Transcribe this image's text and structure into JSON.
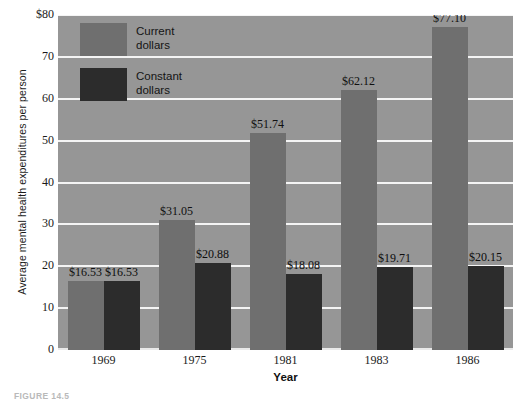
{
  "chart_data": {
    "type": "bar",
    "title": "",
    "xlabel": "Year",
    "ylabel": "Average mental health expenditures per person",
    "categories": [
      "1969",
      "1975",
      "1981",
      "1983",
      "1986"
    ],
    "ylim": [
      0,
      80
    ],
    "yticks": [
      "0",
      "10",
      "20",
      "30",
      "40",
      "50",
      "60",
      "70",
      "$80"
    ],
    "ytick_values": [
      0,
      10,
      20,
      30,
      40,
      50,
      60,
      70,
      80
    ],
    "grid": true,
    "legend_position": "top-left-inside",
    "series": [
      {
        "name": "Current dollars",
        "color": "#6f6f6f",
        "values": [
          16.53,
          31.05,
          51.74,
          62.12,
          77.1
        ],
        "labels": [
          "$16.53",
          "$31.05",
          "$51.74",
          "$62.12",
          "$77.10"
        ]
      },
      {
        "name": "Constant dollars",
        "color": "#2c2c2c",
        "values": [
          16.53,
          20.88,
          18.08,
          19.71,
          20.15
        ],
        "labels": [
          "$16.53",
          "$20.88",
          "$18.08",
          "$19.71",
          "$20.15"
        ]
      }
    ]
  },
  "legend": {
    "items": [
      {
        "label_line1": "Current",
        "label_line2": "dollars",
        "color": "#6f6f6f"
      },
      {
        "label_line1": "Constant",
        "label_line2": "dollars",
        "color": "#2c2c2c"
      }
    ]
  },
  "caption": {
    "text": "FIGURE 14.5"
  },
  "colors": {
    "plot_background": "#969696",
    "gridline": "#f4f4f4",
    "page_background": "#ffffff",
    "current_dollars": "#6f6f6f",
    "constant_dollars": "#2c2c2c",
    "text": "#1a1a1a"
  }
}
